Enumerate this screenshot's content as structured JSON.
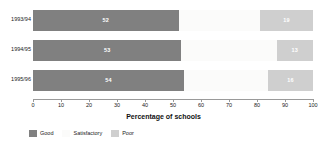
{
  "chart_data": {
    "type": "bar",
    "title": "",
    "subtitle": "",
    "orientation": "horizontal",
    "stacked": true,
    "xlabel": "Percentage of schools",
    "ylabel": "",
    "xlim": [
      0,
      100
    ],
    "xticks": [
      0,
      10,
      20,
      30,
      40,
      50,
      60,
      70,
      80,
      90,
      100
    ],
    "xtick_labels": [
      "0",
      "10",
      "20",
      "30",
      "40",
      "50",
      "60",
      "70",
      "80",
      "90",
      "100"
    ],
    "grid": false,
    "legend_position": "bottom-left",
    "categories": [
      "1993/94",
      "1994/95",
      "1995/96"
    ],
    "series": [
      {
        "name": "Good",
        "color": "#808080",
        "values": [
          52,
          53,
          54
        ],
        "labels": [
          "52",
          "53",
          "54"
        ]
      },
      {
        "name": "Satisfactory",
        "color": "#fbfbfa",
        "values": [
          29,
          34,
          30
        ],
        "labels": [
          "",
          "",
          ""
        ]
      },
      {
        "name": "Poor",
        "color": "#cfcfcf",
        "values": [
          19,
          13,
          16
        ],
        "labels": [
          "19",
          "13",
          "16"
        ]
      }
    ]
  },
  "axis": {
    "title": "Percentage of schools"
  },
  "legend": {
    "items": [
      {
        "label": "Good"
      },
      {
        "label": "Satisfactory"
      },
      {
        "label": "Poor"
      }
    ]
  }
}
